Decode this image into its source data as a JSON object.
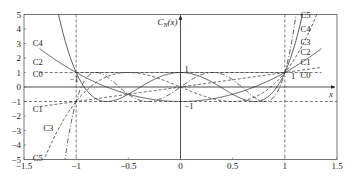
{
  "chart_data": {
    "type": "line",
    "title": "",
    "xlabel": "x",
    "ylabel": "C_N(x)",
    "xlim": [
      -1.5,
      1.5
    ],
    "ylim": [
      -5,
      5
    ],
    "x_ticks": [
      -1.5,
      -1,
      -0.5,
      0,
      0.5,
      1,
      1.5
    ],
    "x_tick_labels": [
      "-1.5",
      "-1",
      "-0.5",
      "0",
      "0.5",
      "1",
      "1.5"
    ],
    "y_ticks": [
      5,
      4,
      3,
      2,
      1,
      0,
      -1,
      -2,
      -3,
      -4,
      -5
    ],
    "y_tick_labels": [
      "5",
      "4",
      "3",
      "2",
      "1",
      "0",
      "-1",
      "-2",
      "-3",
      "-4",
      "-5"
    ],
    "grid": false,
    "legend_position": "inline labels at curve ends",
    "reference_lines": [
      {
        "type": "horizontal",
        "y": 1,
        "x_range": [
          -1,
          1
        ],
        "style": "dashed"
      },
      {
        "type": "horizontal",
        "y": -1,
        "x_range": [
          -1.5,
          1
        ],
        "style": "dashed"
      },
      {
        "type": "vertical",
        "x": -1,
        "style": "dashed"
      },
      {
        "type": "vertical",
        "x": 1,
        "style": "dashed"
      }
    ],
    "annotations": [
      {
        "text": "1",
        "x": 0.02,
        "y": 1.25
      },
      {
        "text": "-1",
        "x": 0.02,
        "y": -1.3
      },
      {
        "text": "-1",
        "x": -1.08,
        "y": 0.55
      },
      {
        "text": "1",
        "x": 1.04,
        "y": 0.75
      }
    ],
    "series": [
      {
        "name": "C0",
        "formula": "1",
        "style": "dashed",
        "label_left": {
          "x": -1.32,
          "y": 0.9
        },
        "label_right": {
          "x": 1.15,
          "y": 0.85
        }
      },
      {
        "name": "C1",
        "formula": "x",
        "style": "dashed",
        "label_left": {
          "x": -1.32,
          "y": -1.5
        },
        "label_right": {
          "x": 1.15,
          "y": 1.7
        }
      },
      {
        "name": "C2",
        "formula": "2x^2-1",
        "style": "solid",
        "label_left": {
          "x": -1.32,
          "y": 1.75
        },
        "label_right": {
          "x": 1.15,
          "y": 2.4
        }
      },
      {
        "name": "C3",
        "formula": "4x^3-3x",
        "style": "dashed",
        "label_left": {
          "x": -1.22,
          "y": -2.8
        },
        "label_right": {
          "x": 1.15,
          "y": 3.1
        }
      },
      {
        "name": "C4",
        "formula": "8x^4-8x^2+1",
        "style": "solid",
        "label_left": {
          "x": -1.32,
          "y": 3.05
        },
        "label_right": {
          "x": 1.15,
          "y": 4.0
        }
      },
      {
        "name": "C5",
        "formula": "16x^5-20x^3+5x",
        "style": "dash-dot",
        "label_left": {
          "x": -1.32,
          "y": -4.9
        },
        "label_right": {
          "x": 1.15,
          "y": 4.95
        }
      }
    ]
  }
}
